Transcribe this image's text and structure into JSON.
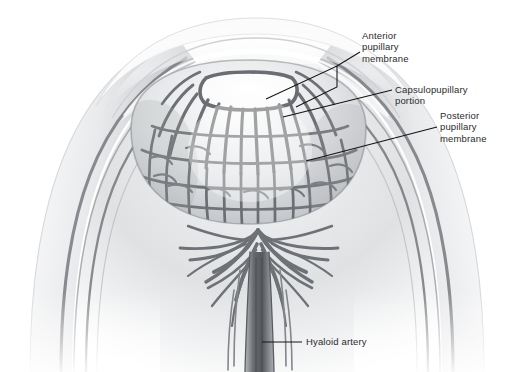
{
  "figure": {
    "background_color": "#ffffff",
    "ink_color": "#6f7276",
    "text_color": "#2b2b2b",
    "leader_color": "#1a1a1a",
    "width": 514,
    "height": 372
  },
  "labels": {
    "anterior": {
      "lines": [
        "Anterior",
        "pupillary",
        "membrane"
      ],
      "text": "Anterior\npupillary\nmembrane"
    },
    "capsulopupillary": {
      "lines": [
        "Capsulopupillary",
        "portion"
      ],
      "text": "Capsulopupillary\nportion"
    },
    "posterior": {
      "lines": [
        "Posterior",
        "pupillary",
        "membrane"
      ],
      "text": "Posterior\npupillary\nmembrane"
    },
    "hyaloid": {
      "lines": [
        "Hyaloid artery"
      ],
      "text": "Hyaloid artery"
    }
  },
  "structures": {
    "cornea": "cornea-arc",
    "sclera": "sclera-outer-wall",
    "choroid": "choroid-layer",
    "retina": "retina-layer",
    "lens": "lens-vesicle",
    "pupil_opening": "central-pupil-aperture",
    "vascular_mesh": "tunica-vasculosa-lentis-network",
    "hyaloid_artery": "hyaloid-artery-trunk",
    "vitreous": "vitreous-chamber"
  }
}
